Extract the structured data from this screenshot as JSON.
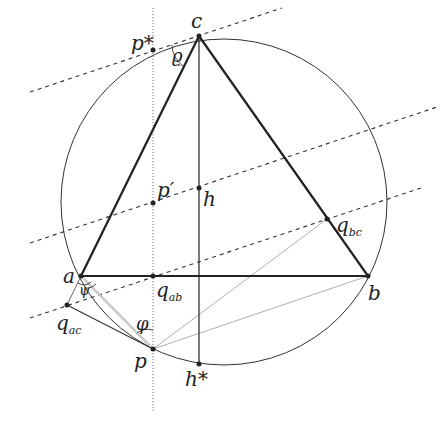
{
  "diagram": {
    "colors": {
      "line": "#222222",
      "thin": "#555555",
      "light": "#999999",
      "bg": "#ffffff"
    },
    "circle": {
      "cx": 224,
      "cy": 202,
      "r": 163
    },
    "points": {
      "a": {
        "x": 81,
        "y": 276,
        "label": "a"
      },
      "b": {
        "x": 368,
        "y": 276,
        "label": "b"
      },
      "c": {
        "x": 199,
        "y": 36,
        "label": "c"
      },
      "h": {
        "x": 199,
        "y": 188,
        "label": "h"
      },
      "h_star": {
        "x": 199,
        "y": 364,
        "label": "h*"
      },
      "p": {
        "x": 153,
        "y": 349,
        "label": "p"
      },
      "p_star": {
        "x": 153,
        "y": 50,
        "label": "p*"
      },
      "p_prime": {
        "x": 153,
        "y": 203,
        "label": "p′"
      },
      "q_ab": {
        "x": 153,
        "y": 276,
        "label": "q",
        "sub": "ab"
      },
      "q_ac": {
        "x": 67,
        "y": 305,
        "label": "q",
        "sub": "ac"
      },
      "q_bc": {
        "x": 327,
        "y": 219,
        "label": "q",
        "sub": "bc"
      }
    },
    "angles": {
      "rho": "ϱ",
      "phi": "φ",
      "psi": "ψ"
    }
  }
}
